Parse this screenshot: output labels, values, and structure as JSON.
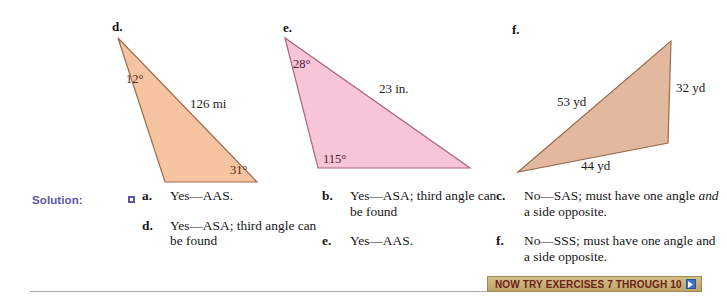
{
  "figures": [
    {
      "id": "d",
      "letter": "d.",
      "fill": "#f6c4a0",
      "stroke": "#9b6b4c",
      "labels": {
        "angle_top": "12°",
        "angle_bottom": "31°",
        "side": "126 mi"
      }
    },
    {
      "id": "e",
      "letter": "e.",
      "fill": "#f8c4d8",
      "stroke": "#a8677f",
      "labels": {
        "angle_top": "28°",
        "angle_bottom": "115°",
        "side": "23 in."
      }
    },
    {
      "id": "f",
      "letter": "f.",
      "fill": "#e2b89e",
      "stroke": "#9b6b4c",
      "labels": {
        "side_left": "53 yd",
        "side_right": "32 yd",
        "side_bottom": "44 yd"
      }
    }
  ],
  "solution": {
    "label": "Solution:",
    "marker_icon": "square-bullet-icon",
    "columns": [
      {
        "name": "column-1",
        "items": [
          {
            "tag": "a.",
            "text": "Yes—AAS."
          },
          {
            "tag": "d.",
            "text": "Yes—ASA; third angle can be found"
          }
        ]
      },
      {
        "name": "column-2",
        "items": [
          {
            "tag": "b.",
            "text": "Yes—ASA; third angle can be found"
          },
          {
            "tag": "e.",
            "text": "Yes—AAS."
          }
        ]
      },
      {
        "name": "column-3",
        "items": [
          {
            "tag": "c.",
            "text_pre": "No—SAS; must have one angle ",
            "text_em": "and",
            "text_post": " a side opposite."
          },
          {
            "tag": "f.",
            "text": "No—SSS; must have one angle and a side opposite."
          }
        ]
      }
    ]
  },
  "banner": {
    "text": "NOW TRY EXERCISES 7 THROUGH 10",
    "arrow_icon": "play-arrow-icon",
    "background_color": "#c9b27a",
    "text_color": "#6d2118",
    "arrow_color": "#3f6fc4"
  }
}
